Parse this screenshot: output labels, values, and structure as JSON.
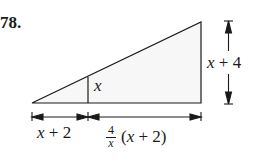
{
  "problem_number": "78.",
  "labels": {
    "inner_height": "x",
    "outer_height_var": "x",
    "outer_height_rest": "+ 4",
    "left_base_var": "x",
    "left_base_rest": "+ 2",
    "frac_num": "4",
    "frac_den": "x",
    "right_base_paren_open": "(",
    "right_base_var": "x",
    "right_base_rest": "+ 2)"
  },
  "colors": {
    "line": "#1a1a1a",
    "fill": "#f4f4f4"
  }
}
